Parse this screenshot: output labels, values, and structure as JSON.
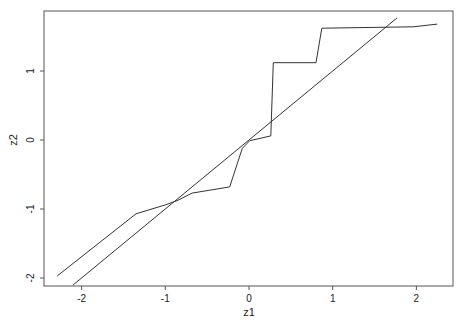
{
  "chart_data": {
    "type": "line",
    "title": "",
    "xlabel": "z1",
    "ylabel": "z2",
    "xlim": [
      -2.45,
      2.43
    ],
    "ylim": [
      -2.12,
      1.86
    ],
    "x_ticks": [
      -2,
      -1,
      0,
      1,
      2
    ],
    "y_ticks": [
      -2,
      -1,
      0,
      1
    ],
    "x_tick_labels": [
      "-2",
      "-1",
      "0",
      "1",
      "2"
    ],
    "y_tick_labels": [
      "-2",
      "-1",
      "0",
      "1"
    ],
    "grid": false,
    "legend": null,
    "series": [
      {
        "name": "curve",
        "x": [
          -2.29,
          -1.35,
          -1.0,
          -0.86,
          -0.68,
          -0.23,
          -0.08,
          0.01,
          0.26,
          0.29,
          0.8,
          0.87,
          1.96,
          2.25
        ],
        "y": [
          -1.97,
          -1.07,
          -0.94,
          -0.88,
          -0.77,
          -0.68,
          -0.12,
          -0.01,
          0.06,
          1.12,
          1.12,
          1.62,
          1.64,
          1.68
        ]
      },
      {
        "name": "reference line y = x",
        "x": [
          -2.1,
          1.77
        ],
        "y": [
          -2.1,
          1.77
        ]
      }
    ]
  }
}
